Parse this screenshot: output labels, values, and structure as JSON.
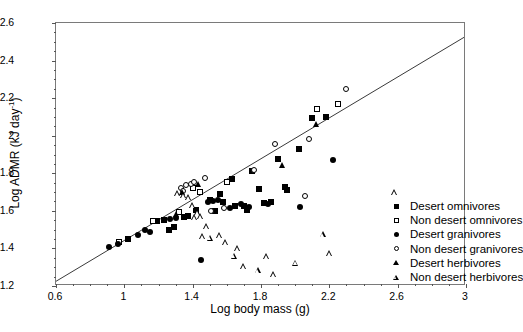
{
  "axes": {
    "y_label_main": "Log ADMR (kJ day",
    "y_label_sup": "-1",
    "y_label_tail": ")",
    "x_label": "Log body mass (g)",
    "y_ticks": [
      "1.2",
      "1.4",
      "1.6",
      "1.8",
      "2",
      "2.2",
      "2.4",
      "2.6"
    ],
    "x_ticks": [
      "0.6",
      "1",
      "1.4",
      "1.8",
      "2.2",
      "2.6",
      "3"
    ]
  },
  "legend": {
    "items": [
      {
        "label": "Desert omnivores",
        "marker": "filled-square"
      },
      {
        "label": "Non desert omnivores",
        "marker": "open-square"
      },
      {
        "label": "Desert granivores",
        "marker": "filled-circle"
      },
      {
        "label": "Non desert granivores",
        "marker": "open-circle"
      },
      {
        "label": "Desert herbivores",
        "marker": "filled-triangle"
      },
      {
        "label": "Non desert herbivores",
        "marker": "open-triangle"
      }
    ]
  },
  "caption": "",
  "chart_data": {
    "type": "scatter",
    "title": "",
    "xlabel": "Log body mass (g)",
    "ylabel": "Log ADMR (kJ day-1)",
    "xlim": [
      0.6,
      3.0
    ],
    "ylim": [
      1.2,
      2.6
    ],
    "x_major_step": 0.4,
    "y_major_step": 0.2,
    "x_minor_step": 0.1,
    "y_minor_step": 0.05,
    "grid": false,
    "legend_position": "right-inside",
    "regression_line": {
      "label": "least-squares fit",
      "x_start": 0.6,
      "y_start": 1.225,
      "x_end": 3.0,
      "y_end": 2.53
    },
    "series": [
      {
        "name": "Desert omnivores",
        "marker": "filled-square",
        "points": [
          [
            1.19,
            1.545
          ],
          [
            1.23,
            1.55
          ],
          [
            1.29,
            1.515
          ],
          [
            1.35,
            1.565
          ],
          [
            1.37,
            1.575
          ],
          [
            1.42,
            1.605
          ],
          [
            1.5,
            1.66
          ],
          [
            1.53,
            1.6
          ],
          [
            1.56,
            1.69
          ],
          [
            1.58,
            1.645
          ],
          [
            1.63,
            1.77
          ],
          [
            1.65,
            1.625
          ],
          [
            1.7,
            1.625
          ],
          [
            1.72,
            1.605
          ],
          [
            1.75,
            1.81
          ],
          [
            1.79,
            1.715
          ],
          [
            1.82,
            1.64
          ],
          [
            1.86,
            1.645
          ],
          [
            1.9,
            1.875
          ],
          [
            1.94,
            1.725
          ],
          [
            1.95,
            1.71
          ],
          [
            2.02,
            1.93
          ],
          [
            2.1,
            2.095
          ],
          [
            2.18,
            2.1
          ],
          [
            1.02,
            1.45
          ],
          [
            1.26,
            1.5
          ]
        ]
      },
      {
        "name": "Non desert omnivores",
        "marker": "open-square",
        "points": [
          [
            0.97,
            1.435
          ],
          [
            1.17,
            1.545
          ],
          [
            1.32,
            1.595
          ],
          [
            1.4,
            1.72
          ],
          [
            1.44,
            1.7
          ],
          [
            1.6,
            1.755
          ],
          [
            2.13,
            2.14
          ],
          [
            2.25,
            2.17
          ]
        ]
      },
      {
        "name": "Desert granivores",
        "marker": "filled-circle",
        "points": [
          [
            0.91,
            1.41
          ],
          [
            0.96,
            1.425
          ],
          [
            1.08,
            1.47
          ],
          [
            1.12,
            1.5
          ],
          [
            1.15,
            1.485
          ],
          [
            1.27,
            1.555
          ],
          [
            1.3,
            1.56
          ],
          [
            1.45,
            1.34
          ],
          [
            1.49,
            1.645
          ],
          [
            1.52,
            1.655
          ],
          [
            1.55,
            1.66
          ],
          [
            1.62,
            1.615
          ],
          [
            1.68,
            1.635
          ],
          [
            1.73,
            1.62
          ],
          [
            1.84,
            1.635
          ],
          [
            2.03,
            1.62
          ],
          [
            2.22,
            1.87
          ]
        ]
      },
      {
        "name": "Non desert granivores",
        "marker": "open-circle",
        "points": [
          [
            1.33,
            1.72
          ],
          [
            1.345,
            1.705
          ],
          [
            1.36,
            1.735
          ],
          [
            1.39,
            1.745
          ],
          [
            1.41,
            1.755
          ],
          [
            1.47,
            1.775
          ],
          [
            1.51,
            1.6
          ],
          [
            1.585,
            1.615
          ],
          [
            1.76,
            1.815
          ],
          [
            1.88,
            1.955
          ],
          [
            2.06,
            1.68
          ],
          [
            2.08,
            1.985
          ],
          [
            2.3,
            2.25
          ]
        ]
      },
      {
        "name": "Desert herbivores",
        "marker": "filled-triangle",
        "points": [
          [
            1.3,
            1.585
          ],
          [
            1.335,
            1.7
          ],
          [
            1.43,
            1.745
          ],
          [
            1.92,
            1.845
          ],
          [
            2.12,
            2.06
          ]
        ]
      },
      {
        "name": "Non desert herbivores",
        "marker": "open-triangle",
        "points": [
          [
            1.31,
            1.695
          ],
          [
            1.345,
            1.715
          ],
          [
            1.375,
            1.735
          ],
          [
            1.395,
            1.725
          ],
          [
            1.41,
            1.695
          ],
          [
            1.425,
            1.755
          ],
          [
            1.445,
            1.765
          ],
          [
            1.455,
            1.69
          ],
          [
            1.48,
            1.775
          ],
          [
            1.5,
            1.745
          ],
          [
            1.555,
            1.79
          ],
          [
            1.59,
            1.785
          ],
          [
            1.64,
            1.745
          ],
          [
            1.66,
            1.815
          ],
          [
            1.695,
            1.755
          ],
          [
            1.78,
            1.765
          ],
          [
            1.83,
            1.87
          ],
          [
            1.87,
            1.805
          ],
          [
            2.0,
            1.9
          ],
          [
            2.16,
            2.085
          ],
          [
            2.2,
            2.015
          ],
          [
            2.58,
            2.37
          ]
        ]
      }
    ]
  }
}
